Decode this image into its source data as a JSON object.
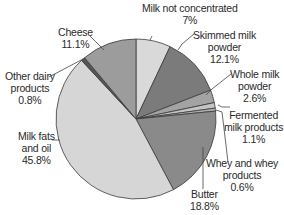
{
  "chart_data": {
    "type": "pie",
    "title": "",
    "start_angle_deg": 0,
    "direction": "clockwise",
    "center": [
      136,
      119
    ],
    "radius": 80,
    "slices": [
      {
        "label": "Milk not concentrated",
        "value": 7.0,
        "value_label": "7%",
        "color": "#d9d9d9"
      },
      {
        "label": "Skimmed milk powder",
        "value": 12.1,
        "value_label": "12.1%",
        "color": "#7b7b7b"
      },
      {
        "label": "Whole milk powder",
        "value": 2.6,
        "value_label": "2.6%",
        "color": "#a3a3a3"
      },
      {
        "label": "Fermented milk products",
        "value": 1.1,
        "value_label": "1.1%",
        "color": "#c4c4c4"
      },
      {
        "label": "Whey and whey products",
        "value": 0.6,
        "value_label": "0.6%",
        "color": "#b0b0b0"
      },
      {
        "label": "Butter",
        "value": 18.8,
        "value_label": "18.8%",
        "color": "#8a8a8a"
      },
      {
        "label": "Milk fats and oil",
        "value": 45.8,
        "value_label": "45.8%",
        "color": "#d6d6d6"
      },
      {
        "label": "Other dairy products",
        "value": 0.8,
        "value_label": "0.8%",
        "color": "#555555"
      },
      {
        "label": "Cheese",
        "value": 11.1,
        "value_label": "11.1%",
        "color": "#9c9c9c"
      }
    ],
    "legend": "none (direct labels with leader lines)"
  },
  "labels": {
    "milk_not_concentrated": {
      "line1": "Milk not concentrated",
      "line2": "7%"
    },
    "skimmed": {
      "line1": "Skimmed milk",
      "line2": "powder",
      "line3": "12.1%"
    },
    "whole": {
      "line1": "Whole milk",
      "line2": "powder",
      "line3": "2.6%"
    },
    "fermented": {
      "line1": "Fermented",
      "line2": "milk products",
      "line3": "1.1%"
    },
    "whey": {
      "line1": "Whey and whey",
      "line2": "products",
      "line3": "0.6%"
    },
    "butter": {
      "line1": "Butter",
      "line2": "18.8%"
    },
    "milk_fats": {
      "line1": "Milk fats",
      "line2": "and oil",
      "line3": "45.8%"
    },
    "other_dairy": {
      "line1": "Other dairy",
      "line2": "products",
      "line3": "0.8%"
    },
    "cheese": {
      "line1": "Cheese",
      "line2": "11.1%"
    }
  }
}
